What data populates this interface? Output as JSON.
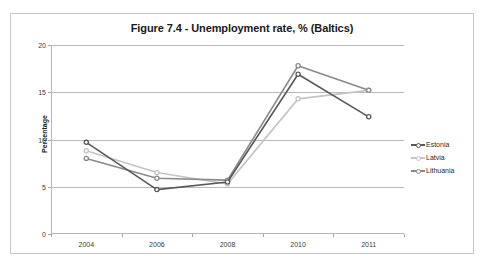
{
  "chart_data": {
    "type": "line",
    "title": "Figure 7.4 - Unemployment rate, % (Baltics)",
    "xlabel": "",
    "ylabel": "Percentage",
    "categories": [
      "2004",
      "2006",
      "2008",
      "2010",
      "2011"
    ],
    "ylim": [
      0,
      20
    ],
    "yticks": [
      0,
      5,
      10,
      15,
      20
    ],
    "ytick_labels": [
      "0",
      "5",
      "10",
      "15",
      "20"
    ],
    "grid": true,
    "legend_position": "right",
    "series": [
      {
        "name": "Estonia",
        "color": "#595959",
        "values": [
          9.7,
          4.7,
          5.5,
          16.9,
          12.4
        ]
      },
      {
        "name": "Latvia",
        "color": "#c4c4c4",
        "values": [
          8.8,
          6.5,
          5.3,
          14.3,
          15.2
        ]
      },
      {
        "name": "Lithuania",
        "color": "#8a8a8a",
        "values": [
          8.0,
          5.9,
          5.7,
          17.8,
          15.2
        ]
      }
    ]
  }
}
